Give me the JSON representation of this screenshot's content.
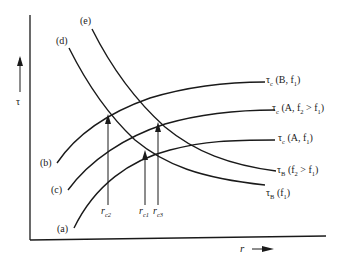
{
  "axes": {
    "y_label": "τ",
    "x_label": "r"
  },
  "curves": [
    {
      "id": "a",
      "tag": "(a)",
      "label_main": "τ",
      "label_sub": "c",
      "label_rest": " (A, f",
      "label_sub2": "1",
      "label_end": ")"
    },
    {
      "id": "b",
      "tag": "(b)",
      "label_main": "τ",
      "label_sub": "c",
      "label_rest": " (B, f",
      "label_sub2": "1",
      "label_end": ")"
    },
    {
      "id": "c",
      "tag": "(c)",
      "label_main": "τ",
      "label_sub": "c",
      "label_rest": " (A, f",
      "label_sub2": "2",
      "label_mid": " > f",
      "label_sub3": "1",
      "label_end": ")"
    },
    {
      "id": "d",
      "tag": "(d)",
      "label_main": "τ",
      "label_sub": "B",
      "label_rest": " (f",
      "label_sub2": "1",
      "label_end": ")"
    },
    {
      "id": "e",
      "tag": "(e)",
      "label_main": "τ",
      "label_sub": "B",
      "label_rest": " (f",
      "label_sub2": "2",
      "label_mid": " > f",
      "label_sub3": "1",
      "label_end": ")"
    }
  ],
  "markers": [
    {
      "id": "rc2",
      "main": "r",
      "sub": "c2"
    },
    {
      "id": "rc1",
      "main": "r",
      "sub": "c1"
    },
    {
      "id": "rc3",
      "main": "r",
      "sub": "c3"
    }
  ]
}
